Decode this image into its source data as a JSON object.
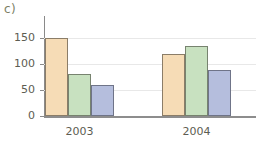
{
  "panel": {
    "label": "c)"
  },
  "chart_data": {
    "type": "bar",
    "title": "",
    "subtitle": "",
    "xlabel": "",
    "ylabel": "",
    "categories": [
      "2003",
      "2004"
    ],
    "series": [
      {
        "name": "series-1",
        "color": "#f6dcb6",
        "values": [
          150,
          120
        ]
      },
      {
        "name": "series-2",
        "color": "#c8e1c0",
        "values": [
          80,
          135
        ]
      },
      {
        "name": "series-3",
        "color": "#b5bedd",
        "values": [
          60,
          88
        ]
      }
    ],
    "ylim": [
      0,
      150
    ],
    "yticks": [
      0,
      50,
      100,
      150
    ],
    "ytick_labels": [
      "0",
      "50",
      "100",
      "150"
    ],
    "xtick_labels": [
      "2003",
      "2004"
    ],
    "grid": true,
    "grid_axis": "y",
    "legend": false,
    "legend_position": "none",
    "axis_color": "#8a8a8a",
    "gridline_color": "#e8e8e8",
    "tick_label_color": "#5d5d52",
    "background": "#ffffff"
  }
}
